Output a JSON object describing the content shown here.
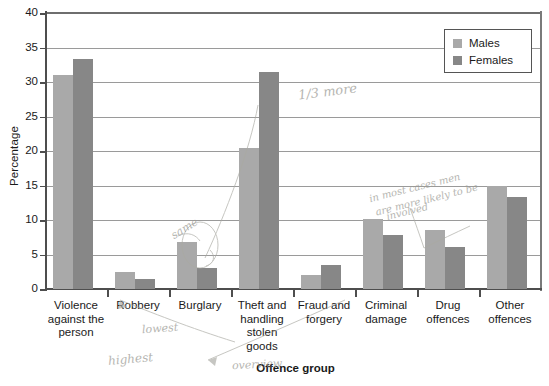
{
  "chart_data": {
    "type": "bar",
    "title": "",
    "xlabel": "Offence group",
    "ylabel": "Percentage",
    "ylim": [
      0,
      40
    ],
    "ytick_step": 5,
    "yticks": [
      "0",
      "5",
      "10",
      "15",
      "20",
      "25",
      "30",
      "35",
      "40"
    ],
    "grid": "horizontal",
    "legend_position": "top-right",
    "categories": [
      "Violence against the person",
      "Robbery",
      "Burglary",
      "Theft and handling stolen goods",
      "Fraud and forgery",
      "Criminal damage",
      "Drug offences",
      "Other offences"
    ],
    "category_label_lines": [
      [
        "Violence",
        "against the",
        "person"
      ],
      [
        "Robbery"
      ],
      [
        "Burglary"
      ],
      [
        "Theft and",
        "handling",
        "stolen",
        "goods"
      ],
      [
        "Fraud and",
        "forgery"
      ],
      [
        "Criminal",
        "damage"
      ],
      [
        "Drug",
        "offences"
      ],
      [
        "Other",
        "offences"
      ]
    ],
    "series": [
      {
        "name": "Males",
        "color": "#a9a9a9",
        "values": [
          31.0,
          2.5,
          6.8,
          20.5,
          2.1,
          10.1,
          8.5,
          15.0
        ]
      },
      {
        "name": "Females",
        "color": "#878787",
        "values": [
          33.4,
          1.5,
          3.1,
          31.5,
          3.5,
          7.8,
          6.1,
          13.3
        ]
      }
    ],
    "annotations": [
      {
        "text": "1/3 more",
        "note": "handwritten, above Theft and handling stolen goods bars"
      },
      {
        "text": "same",
        "note": "handwritten, near Burglary male bar"
      },
      {
        "text": "highest",
        "note": "handwritten, below Violence against the person"
      },
      {
        "text": "lowest",
        "note": "handwritten, below Robbery"
      },
      {
        "text": "overview",
        "note": "handwritten, left of Offence group title"
      },
      {
        "text": "in most cases men",
        "note": "handwritten, above Drug offences"
      },
      {
        "text": "are more likely to be",
        "note": "handwritten, above Drug offences"
      },
      {
        "text": "involved",
        "note": "handwritten, above Drug offences"
      }
    ]
  },
  "legend": {
    "items": [
      {
        "label": "Males",
        "color": "#a9a9a9"
      },
      {
        "label": "Females",
        "color": "#878787"
      }
    ]
  }
}
